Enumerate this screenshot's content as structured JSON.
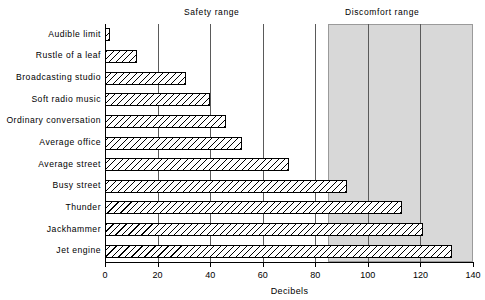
{
  "chart_data": {
    "type": "bar",
    "orientation": "horizontal",
    "title": "",
    "xlabel": "Decibels",
    "ylabel": "",
    "xlim": [
      0,
      140
    ],
    "ylim": null,
    "grid": true,
    "legend": null,
    "xticks": [
      0,
      20,
      40,
      60,
      80,
      100,
      120,
      140
    ],
    "xtick_labels": [
      "0",
      "20",
      "40",
      "60",
      "80",
      "100",
      "120",
      "140"
    ],
    "categories": [
      "Audible limit",
      "Rustle of a leaf",
      "Broadcasting studio",
      "Soft radio music",
      "Ordinary conversation",
      "Average office",
      "Average street",
      "Busy street",
      "Thunder",
      "Jackhammer",
      "Jet engine"
    ],
    "values": [
      2,
      12,
      31,
      40,
      46,
      52,
      70,
      92,
      113,
      121,
      132
    ],
    "bar_style": {
      "fill": "diagonal-hatch",
      "edge_color": "#000000",
      "face_color": "#ffffff"
    },
    "annotations": [
      {
        "name": "safety-range",
        "label": "Safety range",
        "x_start": 0,
        "x_end": 85,
        "shaded": false
      },
      {
        "name": "discomfort-range",
        "label": "Discomfort range",
        "x_start": 85,
        "x_end": 140,
        "shaded": true,
        "shade_color": "#d8d8d8"
      }
    ]
  },
  "labels": {
    "safety_range": "Safety range",
    "discomfort_range": "Discomfort range",
    "x_axis_title": "Decibels"
  }
}
